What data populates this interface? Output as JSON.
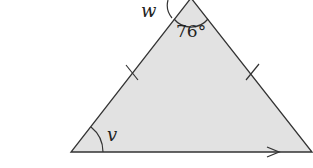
{
  "diagram": {
    "type": "isosceles-triangle",
    "fill_color": "#e2e2e2",
    "stroke_color": "#333333",
    "vertices": {
      "apex": [
        191,
        -2
      ],
      "bottom_left": [
        71,
        152
      ],
      "bottom_right": [
        312,
        152
      ]
    },
    "labels": {
      "apex_angle": "76°",
      "exterior_angle": "w",
      "base_angle": "v"
    },
    "tick_marks": "equal sides (left and right)",
    "base_arrow": "parallel arrow on base"
  }
}
